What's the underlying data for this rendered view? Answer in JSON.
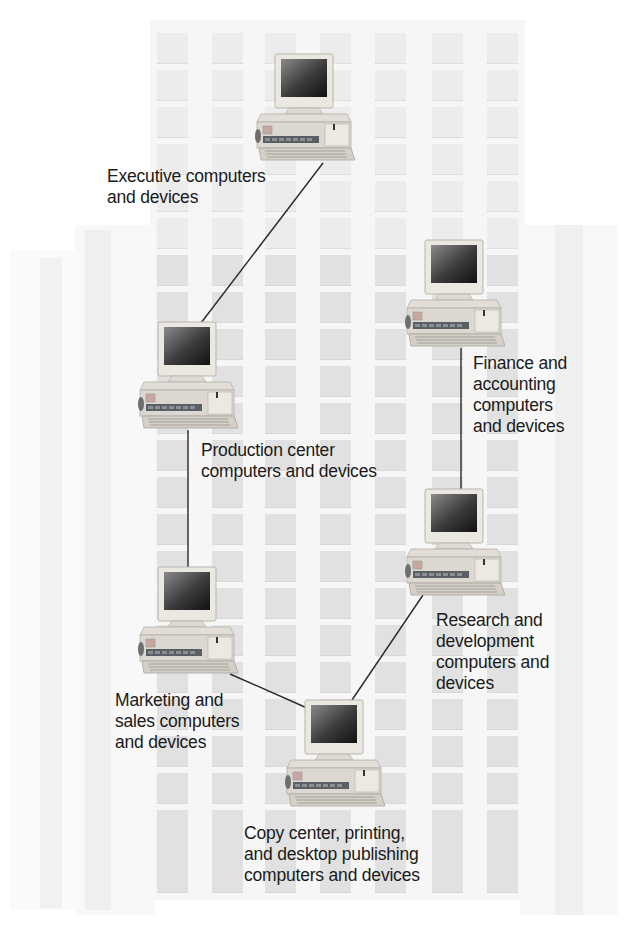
{
  "diagram": {
    "type": "ring-network",
    "colors": {
      "background": "#ffffff",
      "building": "#f6f6f6",
      "tile": "#e3e3e3",
      "line": "#2a2a2a",
      "text": "#1a1a1a"
    },
    "nodes": [
      {
        "id": "executive",
        "label": "Executive computers\nand devices",
        "icon": "desktop-computer-icon"
      },
      {
        "id": "production",
        "label": "Production center\ncomputers and devices",
        "icon": "desktop-computer-icon"
      },
      {
        "id": "finance",
        "label": "Finance and\naccounting\ncomputers\nand devices",
        "icon": "desktop-computer-icon"
      },
      {
        "id": "research",
        "label": "Research and\ndevelopment\ncomputers and\ndevices",
        "icon": "desktop-computer-icon"
      },
      {
        "id": "marketing",
        "label": "Marketing and\nsales computers\nand devices",
        "icon": "desktop-computer-icon"
      },
      {
        "id": "copycenter",
        "label": "Copy center, printing,\nand desktop publishing\ncomputers and devices",
        "icon": "desktop-computer-icon"
      }
    ],
    "links": [
      {
        "from": "executive",
        "to": "production"
      },
      {
        "from": "production",
        "to": "marketing"
      },
      {
        "from": "marketing",
        "to": "copycenter"
      },
      {
        "from": "copycenter",
        "to": "research"
      },
      {
        "from": "research",
        "to": "finance"
      }
    ]
  }
}
